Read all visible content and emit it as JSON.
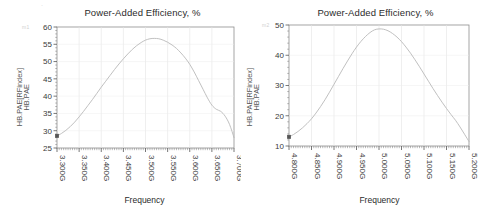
{
  "page": {
    "background": "#ffffff",
    "stray_mark": "·"
  },
  "panels": [
    {
      "id": "left",
      "title": "Power-Added Efficiency, %",
      "ylabel_primary": "HB.PAE[RFindex]",
      "ylabel_secondary": "HB.PAE",
      "xlabel": "Frequency",
      "ghost_label": "m1",
      "chart_data": {
        "type": "line",
        "title": "Power-Added Efficiency, %",
        "xlabel": "Frequency",
        "ylabel": "HB.PAE[RFindex] / HB.PAE",
        "xlim": [
          3.3,
          3.7
        ],
        "ylim": [
          25,
          60
        ],
        "xunit": "GHz",
        "grid": true,
        "legend": false,
        "line_color": "#b9b9b9",
        "marker": {
          "x": 3.3,
          "y": 28.5,
          "shape": "square",
          "color": "#555555"
        },
        "xticks": [
          "3.300G",
          "3.350G",
          "3.400G",
          "3.450G",
          "3.500G",
          "3.550G",
          "3.600G",
          "3.650G",
          "3.700G"
        ],
        "xtick_values": [
          3.3,
          3.35,
          3.4,
          3.45,
          3.5,
          3.55,
          3.6,
          3.65,
          3.7
        ],
        "yticks": [
          25,
          30,
          35,
          40,
          45,
          50,
          55,
          60
        ],
        "minor_ticks_per_interval": 10,
        "x": [
          3.3,
          3.31,
          3.32,
          3.33,
          3.34,
          3.35,
          3.36,
          3.37,
          3.38,
          3.39,
          3.4,
          3.41,
          3.42,
          3.43,
          3.44,
          3.45,
          3.46,
          3.47,
          3.48,
          3.49,
          3.5,
          3.51,
          3.52,
          3.53,
          3.54,
          3.55,
          3.56,
          3.57,
          3.58,
          3.59,
          3.6,
          3.61,
          3.62,
          3.63,
          3.64,
          3.65,
          3.66,
          3.67,
          3.68,
          3.69,
          3.7
        ],
        "values": [
          28.5,
          29.2,
          30.1,
          31.2,
          32.5,
          34.0,
          35.6,
          37.3,
          39.0,
          40.8,
          42.6,
          44.3,
          46.0,
          47.7,
          49.3,
          50.8,
          52.2,
          53.5,
          54.6,
          55.5,
          56.2,
          56.6,
          56.7,
          56.6,
          56.2,
          55.6,
          54.8,
          53.8,
          52.5,
          51.0,
          49.2,
          47.0,
          44.5,
          42.0,
          39.5,
          37.4,
          36.2,
          35.6,
          34.2,
          31.8,
          28.0
        ]
      }
    },
    {
      "id": "right",
      "title": "Power-Added Efficiency, %",
      "ylabel_primary": "HB.PAE[RFindex]",
      "ylabel_secondary": "HB.PAE",
      "xlabel": "Frequency",
      "ghost_label": "m2",
      "chart_data": {
        "type": "line",
        "title": "Power-Added Efficiency, %",
        "xlabel": "Frequency",
        "ylabel": "HB.PAE[RFindex] / HB.PAE",
        "xlim": [
          4.8,
          5.2
        ],
        "ylim": [
          10,
          50
        ],
        "xunit": "GHz",
        "grid": true,
        "legend": false,
        "line_color": "#b9b9b9",
        "marker": {
          "x": 4.8,
          "y": 13.0,
          "shape": "square",
          "color": "#555555"
        },
        "xticks": [
          "4.800G",
          "4.850G",
          "4.900G",
          "4.950G",
          "5.000G",
          "5.050G",
          "5.100G",
          "5.150G",
          "5.200G"
        ],
        "xtick_values": [
          4.8,
          4.85,
          4.9,
          4.95,
          5.0,
          5.05,
          5.1,
          5.15,
          5.2
        ],
        "yticks": [
          10,
          20,
          30,
          40,
          50
        ],
        "minor_ticks_per_interval": 10,
        "x": [
          4.8,
          4.81,
          4.82,
          4.83,
          4.84,
          4.85,
          4.86,
          4.87,
          4.88,
          4.89,
          4.9,
          4.91,
          4.92,
          4.93,
          4.94,
          4.95,
          4.96,
          4.97,
          4.98,
          4.99,
          5.0,
          5.01,
          5.02,
          5.03,
          5.04,
          5.05,
          5.06,
          5.07,
          5.08,
          5.09,
          5.1,
          5.11,
          5.12,
          5.13,
          5.14,
          5.15,
          5.16,
          5.17,
          5.18,
          5.19,
          5.2
        ],
        "values": [
          13.0,
          13.8,
          14.8,
          16.0,
          17.4,
          19.0,
          20.9,
          23.0,
          25.3,
          27.8,
          30.4,
          33.0,
          35.6,
          38.1,
          40.5,
          42.7,
          44.6,
          46.2,
          47.5,
          48.4,
          48.7,
          48.6,
          48.1,
          47.2,
          46.0,
          44.5,
          42.7,
          40.7,
          38.5,
          36.2,
          33.8,
          31.4,
          29.0,
          26.7,
          24.5,
          22.4,
          20.4,
          18.5,
          16.3,
          13.9,
          11.5
        ]
      }
    }
  ]
}
